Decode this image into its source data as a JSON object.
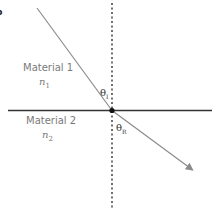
{
  "panel_label": "b",
  "materials": [
    {
      "name": "Material 1",
      "index_symbol": "n",
      "index_subscript": "1"
    },
    {
      "name": "Material 2",
      "index_symbol": "n",
      "index_subscript": "2"
    }
  ],
  "angles": {
    "incident": {
      "symbol": "θ",
      "subscript": "I"
    },
    "refracted": {
      "symbol": "θ",
      "subscript": "R"
    }
  },
  "colors": {
    "interface": "#333333",
    "ray": "#8c8c8c",
    "normal": "#222222",
    "label": "#7a7a7a"
  }
}
